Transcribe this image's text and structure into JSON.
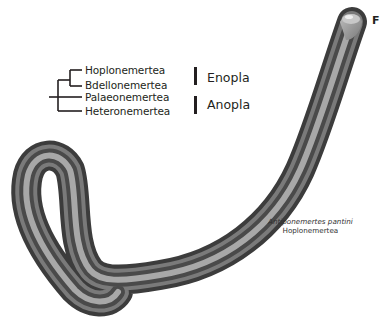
{
  "figure": {
    "panel_label": "F",
    "tree": {
      "taxa": [
        "Hoplonemertea",
        "Bdellonemertea",
        "Palaeonemertea",
        "Heteronemertea"
      ],
      "groups": [
        {
          "label": "Enopla",
          "members": [
            "Hoplonemertea",
            "Bdellonemertea"
          ]
        },
        {
          "label": "Anopla",
          "members": [
            "Palaeonemertea",
            "Heteronemertea"
          ]
        }
      ]
    },
    "specimen": {
      "species": "Antiponemertes pantini",
      "taxon": "Hoplonemertea"
    },
    "colors": {
      "ink": "#231f20",
      "worm_dark": "#3a3a3a",
      "worm_mid": "#6e6e6e",
      "worm_light": "#a9a9a9"
    }
  }
}
